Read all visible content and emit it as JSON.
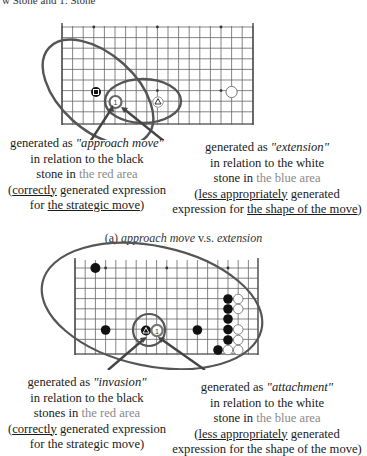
{
  "header_fragment": "w Stone and 1: Stone",
  "panel_a": {
    "left_label": {
      "line1_prefix": "generated as ",
      "line1_term": "\"approach move\"",
      "line2": "in relation to the black",
      "line3_prefix": "stone in ",
      "line3_area": "the red area",
      "line4_open": "(",
      "line4_under": "correctly",
      "line4_rest": " generated expression",
      "line5_prefix": "for ",
      "line5_under": "the strategic move",
      "line5_close": ")"
    },
    "right_label": {
      "line1_prefix": "generated as ",
      "line1_term": "\"extension\"",
      "line2": "in relation to the white",
      "line3_prefix": "stone in ",
      "line3_area": "the blue area",
      "line4_open": "(",
      "line4_under": "less appropriately",
      "line4_rest": " generated",
      "line5_prefix": "expression for ",
      "line5_under": "the shape of the move",
      "line5_close": ")"
    },
    "caption_prefix": "(a) ",
    "caption_term1": "approach move",
    "caption_mid": " v.s. ",
    "caption_term2": "extension",
    "stones": [
      {
        "color": "black",
        "mark": "square"
      },
      {
        "color": "white",
        "mark": "1",
        "highlight": true
      },
      {
        "color": "white",
        "mark": "triangle"
      },
      {
        "color": "white",
        "mark": ""
      }
    ]
  },
  "panel_b": {
    "left_label": {
      "line1_prefix": "generated as ",
      "line1_term": "\"invasion\"",
      "line2": "in relation to the black",
      "line3_prefix": "stones in ",
      "line3_area": "the red area",
      "line4_open": "(",
      "line4_under": "correctly",
      "line4_rest": " generated expression",
      "line5": "for the strategic move)"
    },
    "right_label": {
      "line1_prefix": "generated as ",
      "line1_term": "\"attachment\"",
      "line2": "in relation to the white",
      "line3_prefix": "stone in ",
      "line3_area": "the blue area",
      "line4_open": "(",
      "line4_under": "less appropriately",
      "line4_rest": " generated",
      "line5": "expression for the shape of the move)"
    },
    "stones": [
      {
        "color": "black",
        "mark": "triangle"
      },
      {
        "color": "white",
        "mark": "1",
        "highlight": true
      }
    ]
  },
  "colors": {
    "grid": "#555555",
    "ellipse": "#555555",
    "arrow": "#444444",
    "area_text": "#8a8a8a"
  }
}
